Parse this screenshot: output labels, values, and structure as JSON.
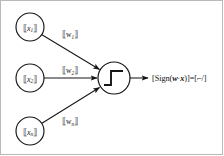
{
  "figure": {
    "background_color": "#ffffff",
    "border_color": "#b9b9b9",
    "stroke_color": "#161616"
  },
  "inputs": [
    {
      "id": "input-1",
      "open_bracket": "⟦",
      "symbol": "x",
      "subscript": "1",
      "close_bracket": "⟧",
      "cx": 30,
      "cy": 27,
      "r": 14
    },
    {
      "id": "input-2",
      "open_bracket": "⟦",
      "symbol": "x",
      "subscript": "2",
      "close_bracket": "⟧",
      "cx": 30,
      "cy": 78,
      "r": 14
    },
    {
      "id": "input-n",
      "open_bracket": "⟦",
      "symbol": "x",
      "subscript": "n",
      "close_bracket": "⟧",
      "cx": 30,
      "cy": 131,
      "r": 14
    }
  ],
  "weights": [
    {
      "id": "weight-1",
      "open_bracket": "⟦",
      "symbol": "w",
      "subscript": "1",
      "close_bracket": "⟧",
      "x": 70,
      "y": 37
    },
    {
      "id": "weight-2",
      "open_bracket": "⟦",
      "symbol": "w",
      "subscript": "2",
      "close_bracket": "⟧",
      "x": 70,
      "y": 73
    },
    {
      "id": "weight-n",
      "open_bracket": "⟦",
      "symbol": "w",
      "subscript": "n",
      "close_bracket": "⟧",
      "x": 70,
      "y": 124
    }
  ],
  "neuron": {
    "id": "activation-node",
    "cx": 114,
    "cy": 78,
    "r": 16,
    "activation": "step-function"
  },
  "output": {
    "id": "output-label",
    "text": "[Sign(w·x)]=[⌐/]",
    "prefix": "[Sign(",
    "w": "w",
    "dot": "·",
    "x": "x",
    "middle": ")]=[",
    "glyph": "⌐/",
    "suffix": "]",
    "x_pos": 152,
    "y_pos": 81
  }
}
